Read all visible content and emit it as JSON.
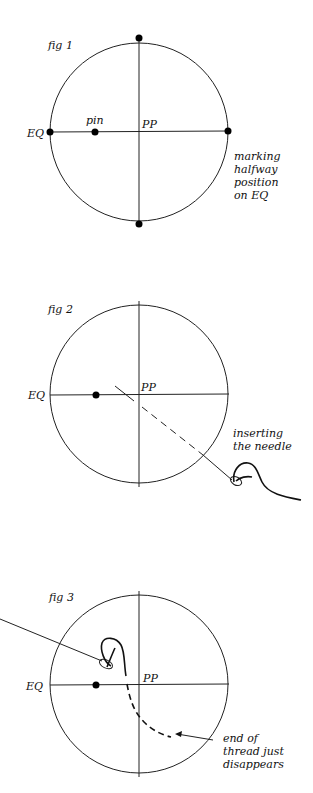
{
  "figures": [
    {
      "title": "fig 1",
      "labels": {
        "eq": "EQ",
        "pp": "PP",
        "pin": "pin",
        "caption": [
          "marking",
          "halfway",
          "position",
          "on EQ"
        ]
      }
    },
    {
      "title": "fig 2",
      "labels": {
        "eq": "EQ",
        "pp": "PP",
        "caption": [
          "inserting",
          "the needle"
        ]
      }
    },
    {
      "title": "fig 3",
      "labels": {
        "eq": "EQ",
        "pp": "PP",
        "caption": [
          "end of",
          "thread just",
          "disappears"
        ]
      }
    }
  ],
  "colors": {
    "ink": "#111111",
    "background": "#ffffff"
  }
}
